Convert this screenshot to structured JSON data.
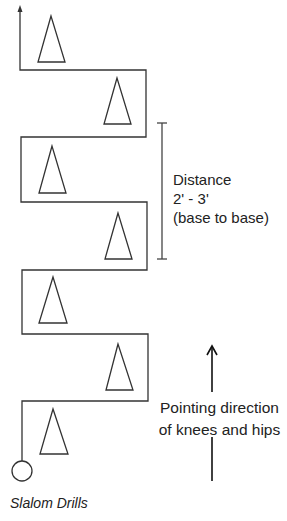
{
  "diagram": {
    "title": "Slalom Drills",
    "distance_annotation": {
      "lines": [
        "Distance",
        "2' - 3'",
        "(base to base)"
      ]
    },
    "direction_annotation": {
      "lines": [
        "Pointing direction",
        "of knees and hips"
      ]
    },
    "cones": 7,
    "colors": {
      "line": "#333333",
      "text": "#222222",
      "background": "#ffffff"
    }
  }
}
